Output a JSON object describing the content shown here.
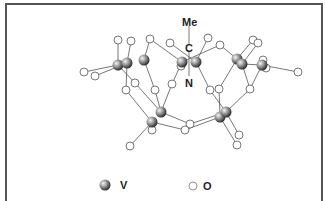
{
  "figure": {
    "labels": {
      "me": "Me",
      "c": "C",
      "n": "N"
    },
    "legend": [
      {
        "symbol": "vanadium-sphere",
        "label": "V",
        "color": "#888888"
      },
      {
        "symbol": "oxygen-circle",
        "label": "O",
        "color": "#ffffff"
      }
    ]
  }
}
